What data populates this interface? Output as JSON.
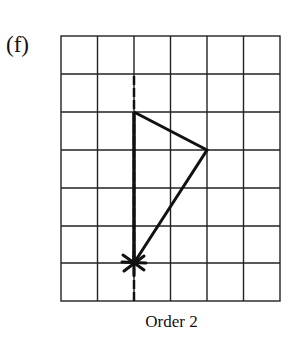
{
  "figure": {
    "label": "(f)",
    "caption": "Order 2",
    "grid": {
      "columns": 6,
      "rows": 7
    },
    "mirror_line": {
      "type": "dashed-vertical",
      "grid_x": 2
    },
    "shape": {
      "vertices_grid": [
        [
          2,
          2
        ],
        [
          4,
          3
        ],
        [
          2,
          6
        ]
      ],
      "center_of_rotation_grid": [
        2,
        6
      ],
      "center_marker": "star"
    }
  }
}
